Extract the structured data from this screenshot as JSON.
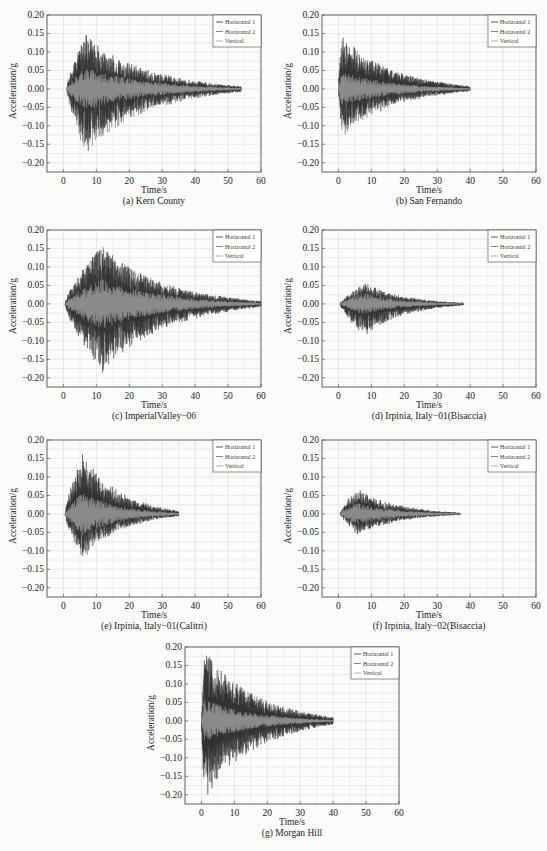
{
  "figure": {
    "panels": [
      {
        "id": "a",
        "caption": "(a) Kern County"
      },
      {
        "id": "b",
        "caption": "(b) San Fernando"
      },
      {
        "id": "c",
        "caption": "(c) ImperialValley−06"
      },
      {
        "id": "d",
        "caption": "(d) Irpinia, Italy−01(Bisaccia)"
      },
      {
        "id": "e",
        "caption": "(e)  Irpinia, Italy−01(Calitri)"
      },
      {
        "id": "f",
        "caption": "(f)  Irpinia, Italy−02(Bisaccia)"
      },
      {
        "id": "g",
        "caption": "(g)  Morgan Hill"
      }
    ],
    "xlabel": "Time/s",
    "ylabel": "Acceleration/g",
    "xticks": [
      "0",
      "10",
      "20",
      "30",
      "40",
      "50",
      "60"
    ],
    "yticks": [
      "0.20",
      "0.15",
      "0.10",
      "0.05",
      "0.00",
      "−0.05",
      "−0.10",
      "−0.15",
      "−0.20"
    ],
    "legend": [
      "Horizontal 1",
      "Horizontal 2",
      "Vertical"
    ],
    "colors": {
      "h1": "#2a2a2a",
      "h2": "#6a6a6a",
      "v": "#9a9a9a",
      "grid": "#d8d8d8",
      "frame": "#444444"
    }
  },
  "chart_data": [
    {
      "type": "line",
      "title": "(a) Kern County",
      "xlabel": "Time/s",
      "ylabel": "Acceleration/g",
      "xlim": [
        -5,
        60
      ],
      "ylim": [
        -0.225,
        0.2
      ],
      "grid": true,
      "legend_position": "upper right",
      "series": [
        {
          "name": "Horizontal 1",
          "duration_s": 53,
          "peak_pos": 0.15,
          "peak_neg": -0.15
        },
        {
          "name": "Horizontal 2",
          "duration_s": 53,
          "peak_pos": 0.13,
          "peak_neg": -0.18
        },
        {
          "name": "Vertical",
          "duration_s": 53,
          "peak_pos": 0.06,
          "peak_neg": -0.06
        }
      ],
      "envelope": {
        "onset_s": 1,
        "peak_time_s": 7,
        "end_s": 54
      }
    },
    {
      "type": "line",
      "title": "(b) San Fernando",
      "xlabel": "Time/s",
      "ylabel": "Acceleration/g",
      "xlim": [
        -5,
        60
      ],
      "ylim": [
        -0.225,
        0.2
      ],
      "grid": true,
      "legend_position": "upper right",
      "series": [
        {
          "name": "Horizontal 1",
          "duration_s": 39,
          "peak_pos": 0.15,
          "peak_neg": -0.12
        },
        {
          "name": "Horizontal 2",
          "duration_s": 39,
          "peak_pos": 0.15,
          "peak_neg": -0.14
        },
        {
          "name": "Vertical",
          "duration_s": 39,
          "peak_pos": 0.05,
          "peak_neg": -0.05
        }
      ],
      "envelope": {
        "onset_s": 0,
        "peak_time_s": 1,
        "end_s": 40
      }
    },
    {
      "type": "line",
      "title": "(c) ImperialValley-06",
      "xlabel": "Time/s",
      "ylabel": "Acceleration/g",
      "xlim": [
        -5,
        60
      ],
      "ylim": [
        -0.225,
        0.2
      ],
      "grid": true,
      "legend_position": "upper right",
      "series": [
        {
          "name": "Horizontal 1",
          "duration_s": 60,
          "peak_pos": 0.16,
          "peak_neg": -0.19
        },
        {
          "name": "Horizontal 2",
          "duration_s": 60,
          "peak_pos": 0.16,
          "peak_neg": -0.16
        },
        {
          "name": "Vertical",
          "duration_s": 60,
          "peak_pos": 0.07,
          "peak_neg": -0.07
        }
      ],
      "envelope": {
        "onset_s": 0.5,
        "peak_time_s": 12,
        "end_s": 60
      }
    },
    {
      "type": "line",
      "title": "(d) Irpinia, Italy-01(Bisaccia)",
      "xlabel": "Time/s",
      "ylabel": "Acceleration/g",
      "xlim": [
        -5,
        60
      ],
      "ylim": [
        -0.225,
        0.2
      ],
      "grid": true,
      "legend_position": "upper right",
      "series": [
        {
          "name": "Horizontal 1",
          "duration_s": 38,
          "peak_pos": 0.06,
          "peak_neg": -0.09
        },
        {
          "name": "Horizontal 2",
          "duration_s": 38,
          "peak_pos": 0.05,
          "peak_neg": -0.08
        },
        {
          "name": "Vertical",
          "duration_s": 38,
          "peak_pos": 0.03,
          "peak_neg": -0.03
        }
      ],
      "envelope": {
        "onset_s": 0.5,
        "peak_time_s": 8,
        "end_s": 38
      }
    },
    {
      "type": "line",
      "title": "(e) Irpinia, Italy-01(Calitri)",
      "xlabel": "Time/s",
      "ylabel": "Acceleration/g",
      "xlim": [
        -5,
        60
      ],
      "ylim": [
        -0.225,
        0.2
      ],
      "grid": true,
      "legend_position": "upper right",
      "series": [
        {
          "name": "Horizontal 1",
          "duration_s": 34,
          "peak_pos": 0.17,
          "peak_neg": -0.12
        },
        {
          "name": "Horizontal 2",
          "duration_s": 34,
          "peak_pos": 0.14,
          "peak_neg": -0.13
        },
        {
          "name": "Vertical",
          "duration_s": 34,
          "peak_pos": 0.06,
          "peak_neg": -0.06
        }
      ],
      "envelope": {
        "onset_s": 0.5,
        "peak_time_s": 6,
        "end_s": 35
      }
    },
    {
      "type": "line",
      "title": "(f) Irpinia, Italy-02(Bisaccia)",
      "xlabel": "Time/s",
      "ylabel": "Acceleration/g",
      "xlim": [
        -5,
        60
      ],
      "ylim": [
        -0.225,
        0.2
      ],
      "grid": true,
      "legend_position": "upper right",
      "series": [
        {
          "name": "Horizontal",
          "duration_s": 37,
          "peak_pos": 0.07,
          "peak_neg": -0.06
        },
        {
          "name": "Horizontal 2",
          "duration_s": 37,
          "peak_pos": 0.06,
          "peak_neg": -0.05
        },
        {
          "name": "Vertical",
          "duration_s": 37,
          "peak_pos": 0.03,
          "peak_neg": -0.03
        }
      ],
      "envelope": {
        "onset_s": 0.5,
        "peak_time_s": 6,
        "end_s": 37
      }
    },
    {
      "type": "line",
      "title": "(g) Morgan Hill",
      "xlabel": "Time/s",
      "ylabel": "Acceleration/g",
      "xlim": [
        -5,
        60
      ],
      "ylim": [
        -0.225,
        0.2
      ],
      "grid": true,
      "legend_position": "upper right",
      "series": [
        {
          "name": "Horizontal 1",
          "duration_s": 40,
          "peak_pos": 0.2,
          "peak_neg": -0.22
        },
        {
          "name": "Horizontal 2",
          "duration_s": 40,
          "peak_pos": 0.2,
          "peak_neg": -0.16
        },
        {
          "name": "Vertical",
          "duration_s": 40,
          "peak_pos": 0.06,
          "peak_neg": -0.06
        }
      ],
      "envelope": {
        "onset_s": 0,
        "peak_time_s": 1,
        "end_s": 40
      }
    }
  ]
}
